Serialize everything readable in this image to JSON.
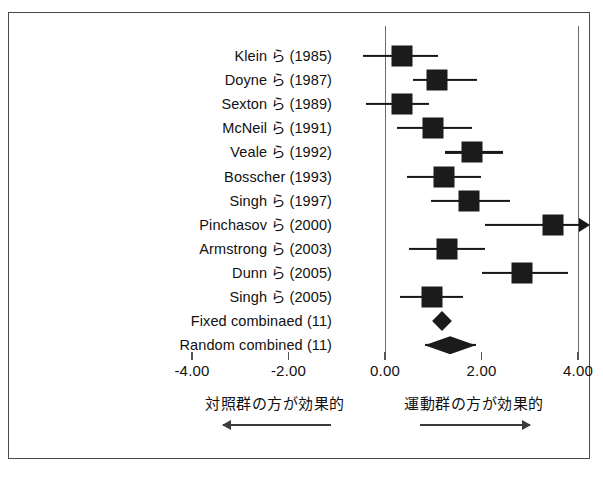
{
  "chart_data": {
    "type": "scatter",
    "subtype": "forest-plot",
    "title": "",
    "xlabel": "",
    "ylabel": "",
    "xlim": [
      -4.0,
      4.0
    ],
    "grid": false,
    "reference_lines": [
      0.0,
      4.0
    ],
    "axis_ticks": [
      "-4.00",
      "-2.00",
      "0.00",
      "2.00",
      "4.00"
    ],
    "axis_tick_values": [
      -4.0,
      -2.0,
      0.0,
      2.0,
      4.0
    ],
    "categories": [
      "Klein ら (1985)",
      "Doyne ら (1987)",
      "Sexton ら (1989)",
      "McNeil ら (1991)",
      "Veale ら (1992)",
      "Bosscher (1993)",
      "Singh ら (1997)",
      "Pinchasov ら (2000)",
      "Armstrong ら (2003)",
      "Dunn ら (2005)",
      "Singh ら (2005)",
      "Fixed combinaed (11)",
      "Random combined (11)"
    ],
    "rows": [
      {
        "label": "Klein ら (1985)",
        "effect": 0.35,
        "ci_low": -0.45,
        "ci_high": 1.1,
        "marker": "square",
        "truncated_right": false
      },
      {
        "label": "Doyne ら (1987)",
        "effect": 1.08,
        "ci_low": 0.58,
        "ci_high": 1.9,
        "marker": "square",
        "truncated_right": false
      },
      {
        "label": "Sexton ら (1989)",
        "effect": 0.35,
        "ci_low": -0.4,
        "ci_high": 0.92,
        "marker": "square",
        "truncated_right": false
      },
      {
        "label": "McNeil ら (1991)",
        "effect": 1.0,
        "ci_low": 0.25,
        "ci_high": 1.8,
        "marker": "square",
        "truncated_right": false
      },
      {
        "label": "Veale ら (1992)",
        "effect": 1.8,
        "ci_low": 1.25,
        "ci_high": 2.45,
        "marker": "square",
        "truncated_right": false
      },
      {
        "label": "Bosscher (1993)",
        "effect": 1.22,
        "ci_low": 0.45,
        "ci_high": 2.0,
        "marker": "square",
        "truncated_right": false
      },
      {
        "label": "Singh ら (1997)",
        "effect": 1.75,
        "ci_low": 0.95,
        "ci_high": 2.6,
        "marker": "square",
        "truncated_right": false
      },
      {
        "label": "Pinchasov ら (2000)",
        "effect": 3.48,
        "ci_low": 2.07,
        "ci_high": 4.25,
        "marker": "square",
        "truncated_right": true
      },
      {
        "label": "Armstrong ら (2003)",
        "effect": 1.28,
        "ci_low": 0.5,
        "ci_high": 2.08,
        "marker": "square",
        "truncated_right": false
      },
      {
        "label": "Dunn ら (2005)",
        "effect": 2.84,
        "ci_low": 2.0,
        "ci_high": 3.8,
        "marker": "square",
        "truncated_right": false
      },
      {
        "label": "Singh ら (2005)",
        "effect": 0.97,
        "ci_low": 0.32,
        "ci_high": 1.62,
        "marker": "square",
        "truncated_right": false
      },
      {
        "label": "Fixed combinaed (11)",
        "effect": 1.18,
        "ci_low": 1.05,
        "ci_high": 1.31,
        "marker": "diamond",
        "truncated_right": false
      },
      {
        "label": "Random combined (11)",
        "effect": 1.35,
        "ci_low": 0.82,
        "ci_high": 1.88,
        "marker": "diamond-wide",
        "truncated_right": false
      }
    ],
    "annotations": {
      "left_label": "対照群の方が効果的",
      "right_label": "運動群の方が効果的",
      "left_arrow_direction": "left",
      "right_arrow_direction": "right"
    },
    "source_note": ""
  },
  "colors": {
    "marker": "#1b1b1b",
    "line": "#171717",
    "frame": "#4a4a4a",
    "reference_line": "#6b6b6b",
    "text": "#111111"
  }
}
